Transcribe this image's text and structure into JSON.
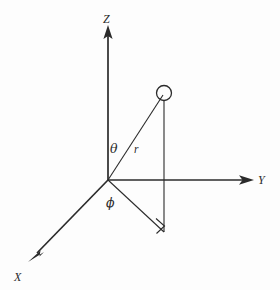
{
  "figure": {
    "background_color": "#fdfdfd",
    "stroke_color": "#2b2b2b",
    "width": 280,
    "height": 290
  },
  "axes": {
    "z": {
      "label": "Z",
      "label_x": 105,
      "label_y": 22,
      "from": [
        108,
        180
      ],
      "to": [
        108,
        30
      ]
    },
    "y": {
      "label": "Y",
      "label_x": 259,
      "label_y": 184,
      "from": [
        108,
        180
      ],
      "to": [
        254,
        180
      ]
    },
    "x": {
      "label": "X",
      "label_x": 16,
      "label_y": 280,
      "from": [
        108,
        180
      ],
      "to": [
        29,
        261
      ]
    }
  },
  "origin": {
    "label": "origin",
    "x": 108,
    "y": 180
  },
  "point": {
    "label": "point-marker",
    "cx": 164,
    "cy": 93,
    "r": 7.5
  },
  "projection": {
    "label": "foot-of-perpendicular",
    "x": 164,
    "y": 232
  },
  "annotations": {
    "theta": {
      "symbol": "θ",
      "x": 110,
      "y": 152,
      "meaning": "polar-angle-from-z-axis"
    },
    "phi": {
      "symbol": "ϕ",
      "x": 107,
      "y": 206,
      "meaning": "azimuthal-angle-from-x-axis"
    },
    "r": {
      "symbol": "r",
      "x": 134,
      "y": 152,
      "meaning": "radial-distance"
    }
  },
  "segments": {
    "radius_line": {
      "name": "radius-line-r",
      "from": [
        108,
        180
      ],
      "to": [
        164,
        93
      ]
    },
    "vertical_drop": {
      "name": "vertical-projection-line",
      "from": [
        164,
        93
      ],
      "to": [
        164,
        232
      ]
    },
    "ground_projection": {
      "name": "ground-projection-line",
      "from": [
        108,
        180
      ],
      "to": [
        164,
        232
      ]
    }
  },
  "right_angle_marker": {
    "name": "right-angle-marker",
    "points": "157,219 164,226 157,233"
  }
}
